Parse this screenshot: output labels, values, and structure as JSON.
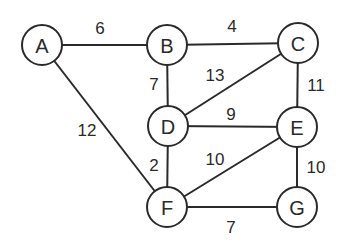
{
  "graph": {
    "type": "weighted-undirected-graph",
    "nodes": [
      {
        "id": "A",
        "label": "A",
        "x": 42,
        "y": 45
      },
      {
        "id": "B",
        "label": "B",
        "x": 167,
        "y": 45
      },
      {
        "id": "C",
        "label": "C",
        "x": 298,
        "y": 43
      },
      {
        "id": "D",
        "label": "D",
        "x": 168,
        "y": 126
      },
      {
        "id": "E",
        "label": "E",
        "x": 297,
        "y": 127
      },
      {
        "id": "F",
        "label": "F",
        "x": 167,
        "y": 207
      },
      {
        "id": "G",
        "label": "G",
        "x": 297,
        "y": 207
      }
    ],
    "edges": [
      {
        "from": "A",
        "to": "B",
        "weight": "6",
        "lx": 100,
        "ly": 28
      },
      {
        "from": "B",
        "to": "C",
        "weight": "4",
        "lx": 232,
        "ly": 26
      },
      {
        "from": "B",
        "to": "D",
        "weight": "7",
        "lx": 154,
        "ly": 84
      },
      {
        "from": "A",
        "to": "F",
        "weight": "12",
        "lx": 87,
        "ly": 130
      },
      {
        "from": "D",
        "to": "C",
        "weight": "13",
        "lx": 215,
        "ly": 75
      },
      {
        "from": "C",
        "to": "E",
        "weight": "11",
        "lx": 314,
        "ly": 85
      },
      {
        "from": "D",
        "to": "E",
        "weight": "9",
        "lx": 231,
        "ly": 114
      },
      {
        "from": "D",
        "to": "F",
        "weight": "2",
        "lx": 154,
        "ly": 165
      },
      {
        "from": "F",
        "to": "E",
        "weight": "10",
        "lx": 215,
        "ly": 159
      },
      {
        "from": "E",
        "to": "G",
        "weight": "10",
        "lx": 316,
        "ly": 167
      },
      {
        "from": "F",
        "to": "G",
        "weight": "7",
        "lx": 231,
        "ly": 227
      }
    ]
  }
}
